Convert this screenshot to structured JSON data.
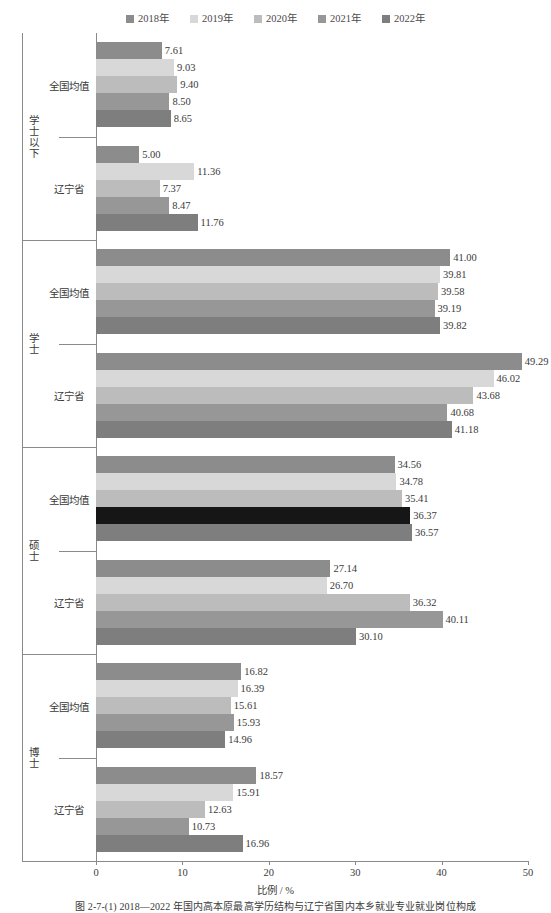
{
  "legend": {
    "position": "top-center",
    "entries": [
      {
        "label": "2018年",
        "color": "#8c8c8c"
      },
      {
        "label": "2019年",
        "color": "#d8d8d8"
      },
      {
        "label": "2020年",
        "color": "#bcbcbc"
      },
      {
        "label": "2021年",
        "color": "#979797"
      },
      {
        "label": "2022年",
        "color": "#7e7e7e"
      }
    ]
  },
  "axis": {
    "x_title": "比例 / %",
    "x_ticks": [
      "0",
      "10",
      "20",
      "30",
      "40",
      "50"
    ],
    "x_min": 0,
    "x_max": 50
  },
  "caption": {
    "text": "图 2-7-(1)  2018—2022 年国内高本原最高学历结构与辽宁省国内本乡就业专业就业岗位构成"
  },
  "chart_data": {
    "type": "bar",
    "orientation": "horizontal",
    "title": "",
    "xlabel": "比例 / %",
    "ylabel": "",
    "xlim": [
      0,
      50
    ],
    "grid": false,
    "legend_position": "top-center",
    "series": [
      {
        "name": "2018年",
        "color": "#8c8c8c"
      },
      {
        "name": "2019年",
        "color": "#d8d8d8"
      },
      {
        "name": "2020年",
        "color": "#bcbcbc"
      },
      {
        "name": "2021年",
        "color": "#979797"
      },
      {
        "name": "2022年",
        "color": "#7e7e7e"
      }
    ],
    "groups": [
      {
        "group_label": "学士以下",
        "subgroups": [
          {
            "subgroup_label": "全国均值",
            "values": [
              7.61,
              9.03,
              9.4,
              8.5,
              8.65
            ],
            "value_labels": [
              "7.61",
              "9.03",
              "9.40",
              "8.50",
              "8.65"
            ]
          },
          {
            "subgroup_label": "辽宁省",
            "values": [
              5.0,
              11.36,
              7.37,
              8.47,
              11.76
            ],
            "value_labels": [
              "5.00",
              "11.36",
              "7.37",
              "8.47",
              "11.76"
            ]
          }
        ]
      },
      {
        "group_label": "学士",
        "subgroups": [
          {
            "subgroup_label": "全国均值",
            "values": [
              41.0,
              39.81,
              39.58,
              39.19,
              39.82
            ],
            "value_labels": [
              "41.00",
              "39.81",
              "39.58",
              "39.19",
              "39.82"
            ]
          },
          {
            "subgroup_label": "辽宁省",
            "values": [
              49.29,
              46.02,
              43.68,
              40.68,
              41.18
            ],
            "value_labels": [
              "49.29",
              "46.02",
              "43.68",
              "40.68",
              "41.18"
            ]
          }
        ]
      },
      {
        "group_label": "硕士",
        "subgroups": [
          {
            "subgroup_label": "全国均值",
            "values": [
              34.56,
              34.78,
              35.41,
              36.37,
              36.57
            ],
            "value_labels": [
              "34.56",
              "34.78",
              "35.41",
              "36.37",
              "36.57"
            ],
            "bar_color_overrides": {
              "3": "#161616"
            }
          },
          {
            "subgroup_label": "辽宁省",
            "values": [
              27.14,
              26.7,
              36.32,
              40.11,
              30.1
            ],
            "value_labels": [
              "27.14",
              "26.70",
              "36.32",
              "40.11",
              "30.10"
            ]
          }
        ]
      },
      {
        "group_label": "博士",
        "subgroups": [
          {
            "subgroup_label": "全国均值",
            "values": [
              16.82,
              16.39,
              15.61,
              15.93,
              14.96
            ],
            "value_labels": [
              "16.82",
              "16.39",
              "15.61",
              "15.93",
              "14.96"
            ]
          },
          {
            "subgroup_label": "辽宁省",
            "values": [
              18.57,
              15.91,
              12.63,
              10.73,
              16.96
            ],
            "value_labels": [
              "18.57",
              "15.91",
              "12.63",
              "10.73",
              "16.96"
            ]
          }
        ]
      }
    ]
  }
}
